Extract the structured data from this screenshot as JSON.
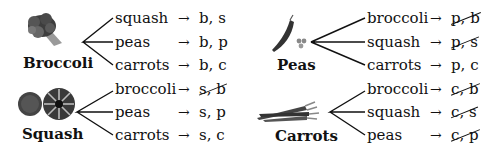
{
  "diagram": {
    "type": "tree-diagram",
    "groups": [
      {
        "name": "Broccoli",
        "icon": "broccoli-icon",
        "branches": [
          {
            "label": "squash",
            "arrow": "→",
            "result_a": "b",
            "sep": ", ",
            "result_b": "s",
            "crossed": false
          },
          {
            "label": "peas",
            "arrow": "→",
            "result_a": "b",
            "sep": ", ",
            "result_b": "p",
            "crossed": false
          },
          {
            "label": "carrots",
            "arrow": "→",
            "result_a": "b",
            "sep": ", ",
            "result_b": "c",
            "crossed": false
          }
        ]
      },
      {
        "name": "Peas",
        "icon": "peapod-icon",
        "branches": [
          {
            "label": "broccoli",
            "arrow": "→",
            "result_a": "p",
            "sep": ", ",
            "result_b": "b",
            "crossed": true
          },
          {
            "label": "squash",
            "arrow": "→",
            "result_a": "p",
            "sep": ", ",
            "result_b": "s",
            "crossed": true
          },
          {
            "label": "carrots",
            "arrow": "→",
            "result_a": "p",
            "sep": ", ",
            "result_b": "c",
            "crossed": false
          }
        ]
      },
      {
        "name": "Squash",
        "icon": "squash-icon",
        "branches": [
          {
            "label": "broccoli",
            "arrow": "→",
            "result_a": "s",
            "sep": ", ",
            "result_b": "b",
            "crossed": true
          },
          {
            "label": "peas",
            "arrow": "→",
            "result_a": "s",
            "sep": ", ",
            "result_b": "p",
            "crossed": false
          },
          {
            "label": "carrots",
            "arrow": "→",
            "result_a": "s",
            "sep": ", ",
            "result_b": "c",
            "crossed": false
          }
        ]
      },
      {
        "name": "Carrots",
        "icon": "carrots-icon",
        "branches": [
          {
            "label": "broccoli",
            "arrow": "→",
            "result_a": "c",
            "sep": ", ",
            "result_b": "b",
            "crossed": true
          },
          {
            "label": "squash",
            "arrow": "→",
            "result_a": "c",
            "sep": ", ",
            "result_b": "s",
            "crossed": true
          },
          {
            "label": "peas",
            "arrow": "→",
            "result_a": "c",
            "sep": ", ",
            "result_b": "p",
            "crossed": true
          }
        ]
      }
    ]
  },
  "colors": {
    "text": "#111111",
    "line": "#111111",
    "background": "#ffffff"
  }
}
